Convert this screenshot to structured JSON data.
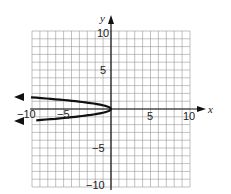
{
  "chart_data": {
    "type": "line",
    "title": "",
    "xlabel": "x",
    "ylabel": "y",
    "xlim": [
      -10,
      10
    ],
    "ylim": [
      -10,
      10
    ],
    "grid": true,
    "x_ticks_labeled": [
      "-10",
      "-5",
      "5",
      "10"
    ],
    "y_ticks_labeled": [
      "10",
      "5",
      "-5",
      "-10"
    ],
    "series": [
      {
        "name": "parabola opening left",
        "equation_estimate": "x = -4.5y^2",
        "vertex": [
          0,
          0
        ],
        "points": [
          [
            -11,
            1.55
          ],
          [
            -8,
            1.33
          ],
          [
            -4.5,
            1
          ],
          [
            -1.1,
            0.5
          ],
          [
            0,
            0
          ],
          [
            -1.1,
            -0.5
          ],
          [
            -4.5,
            -1
          ],
          [
            -8,
            -1.33
          ],
          [
            -11,
            -1.55
          ]
        ],
        "arrows": "both ends pointing left"
      }
    ]
  },
  "labels": {
    "x_axis": "x",
    "y_axis": "y",
    "x_neg10": "−10",
    "x_neg5": "−5",
    "x_5": "5",
    "x_10": "10",
    "y_10": "10",
    "y_5": "5",
    "y_neg5": "−5",
    "y_neg10": "−10"
  }
}
